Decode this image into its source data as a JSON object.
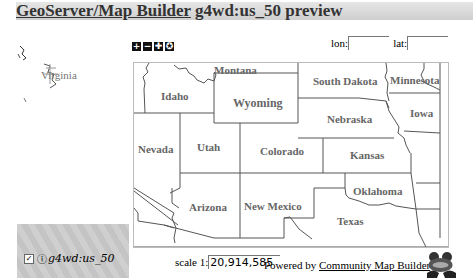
{
  "header": {
    "title_link": "GeoServer/Map Builder",
    "title_rest": " g4wd:us_50 preview"
  },
  "locator": {
    "label": "Virginia"
  },
  "toolbar": {
    "buttons": [
      {
        "name": "zoom-in",
        "glyph": "+"
      },
      {
        "name": "zoom-out",
        "glyph": "−"
      },
      {
        "name": "pan",
        "glyph": "✚"
      },
      {
        "name": "reset",
        "glyph": "✪"
      }
    ]
  },
  "coords": {
    "lon_label": "lon:",
    "lon_value": "",
    "lat_label": "lat:",
    "lat_value": ""
  },
  "map": {
    "states": [
      {
        "name": "Montana",
        "x": 80,
        "y": 1
      },
      {
        "name": "Idaho",
        "x": 27,
        "y": 27
      },
      {
        "name": "Wyoming",
        "x": 99,
        "y": 33
      },
      {
        "name": "South Dakota",
        "x": 179,
        "y": 12
      },
      {
        "name": "Minnesota",
        "x": 256,
        "y": 11
      },
      {
        "name": "Iowa",
        "x": 276,
        "y": 44
      },
      {
        "name": "Nebraska",
        "x": 193,
        "y": 50
      },
      {
        "name": "Nevada",
        "x": 4,
        "y": 80
      },
      {
        "name": "Utah",
        "x": 63,
        "y": 78
      },
      {
        "name": "Colorado",
        "x": 126,
        "y": 82
      },
      {
        "name": "Kansas",
        "x": 216,
        "y": 86
      },
      {
        "name": "Oklahoma",
        "x": 219,
        "y": 122
      },
      {
        "name": "Arizona",
        "x": 55,
        "y": 138
      },
      {
        "name": "New Mexico",
        "x": 110,
        "y": 137
      },
      {
        "name": "Texas",
        "x": 203,
        "y": 152
      }
    ]
  },
  "legend": {
    "layer_checked": "✓",
    "info_glyph": "ⓘ",
    "layer_name": "g4wd:us_50"
  },
  "scale": {
    "label": "scale 1:",
    "value": "20,914,585"
  },
  "footer": {
    "powered_by": "Powered by ",
    "link": "Community Map Builder"
  }
}
